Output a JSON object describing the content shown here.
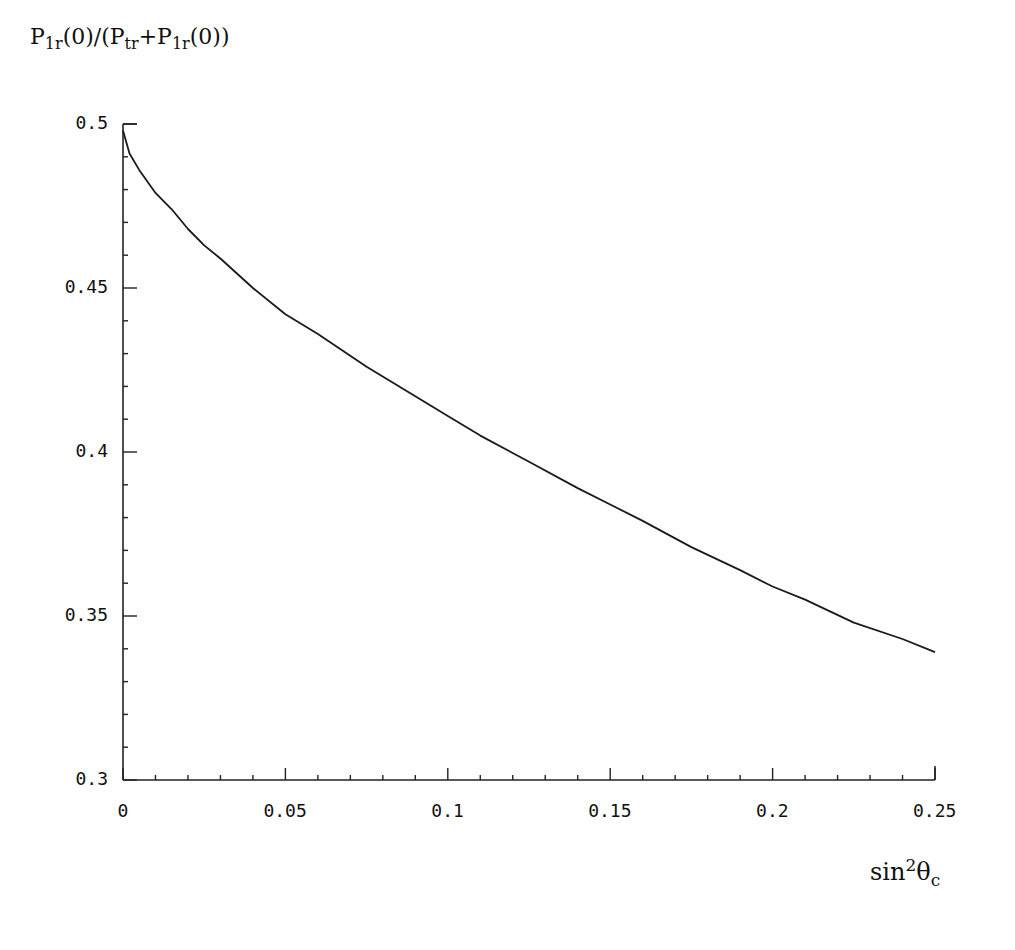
{
  "chart_data": {
    "type": "line",
    "title": "",
    "ylabel": "P_1r(0)/(P_tr+P_1r(0))",
    "xlabel": "sin^2 θ_c",
    "xlim": [
      0,
      0.25
    ],
    "ylim": [
      0.3,
      0.5
    ],
    "grid": false,
    "legend": null,
    "x_ticks": [
      "0",
      "0.05",
      "0.1",
      "0.15",
      "0.2",
      "0.25"
    ],
    "y_ticks": [
      "0.3",
      "0.35",
      "0.4",
      "0.45",
      "0.5"
    ],
    "series": [
      {
        "name": "ratio",
        "x": [
          0,
          0.002,
          0.005,
          0.01,
          0.015,
          0.02,
          0.025,
          0.03,
          0.04,
          0.05,
          0.06,
          0.075,
          0.09,
          0.1,
          0.11,
          0.125,
          0.14,
          0.15,
          0.16,
          0.175,
          0.19,
          0.2,
          0.21,
          0.225,
          0.24,
          0.25
        ],
        "values": [
          0.498,
          0.491,
          0.486,
          0.479,
          0.474,
          0.468,
          0.463,
          0.459,
          0.45,
          0.442,
          0.436,
          0.426,
          0.417,
          0.411,
          0.405,
          0.397,
          0.389,
          0.384,
          0.379,
          0.371,
          0.364,
          0.359,
          0.355,
          0.348,
          0.343,
          0.339
        ]
      }
    ]
  },
  "labels": {
    "y_axis_main": "P",
    "y_axis_sub1": "1r",
    "y_axis_mid1": "(0)/(P",
    "y_axis_sub2": "tr",
    "y_axis_mid2": "+P",
    "y_axis_sub3": "1r",
    "y_axis_end": "(0))",
    "x_axis_main": "sin",
    "x_axis_sup": "2",
    "x_axis_theta": "θ",
    "x_axis_sub": "c"
  }
}
